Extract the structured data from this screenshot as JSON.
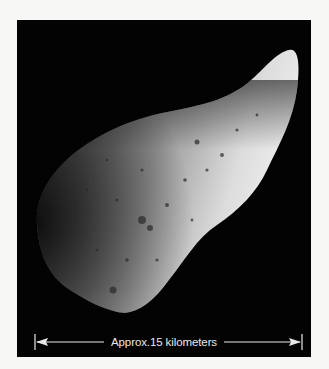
{
  "figure": {
    "background_color": "#030303",
    "page_color": "#f7f7f5",
    "scale_bar": {
      "label": "Approx.15 kilometers",
      "color": "#e8e8e8",
      "left_end_icon": "arrow-left-icon",
      "right_end_icon": "arrow-right-icon"
    }
  }
}
